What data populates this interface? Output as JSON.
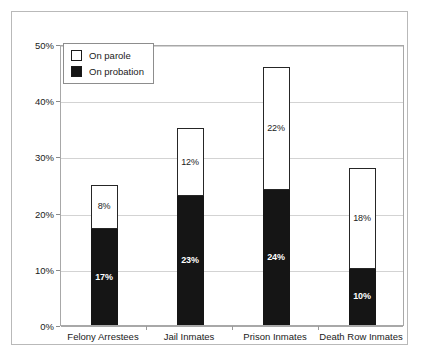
{
  "chart_data": {
    "type": "bar",
    "subtype": "stacked-bar",
    "title": "",
    "subtitle": "",
    "xlabel": "",
    "ylabel": "",
    "ylim": [
      0,
      50
    ],
    "y_tick_labels": [
      "0%",
      "10%",
      "20%",
      "30%",
      "40%",
      "50%"
    ],
    "y_tick_values": [
      0,
      10,
      20,
      30,
      40,
      50
    ],
    "grid": true,
    "legend_position": "top-left-inside",
    "categories": [
      "Felony Arrestees",
      "Jail Inmates",
      "Prison Inmates",
      "Death Row Inmates"
    ],
    "series": [
      {
        "name": "On probation",
        "color": "#151515",
        "text_color": "#ffffff",
        "values": [
          17,
          23,
          24,
          10
        ],
        "data_labels": [
          "17%",
          "23%",
          "24%",
          "10%"
        ]
      },
      {
        "name": "On parole",
        "color": "#ffffff",
        "text_color": "#1a1a1a",
        "values": [
          8,
          12,
          22,
          18
        ],
        "data_labels": [
          "8%",
          "12%",
          "22%",
          "18%"
        ]
      }
    ],
    "stack_totals": [
      25,
      35,
      46,
      28
    ]
  },
  "legend": {
    "items": [
      {
        "label": "On parole",
        "swatch": "white"
      },
      {
        "label": "On probation",
        "swatch": "black"
      }
    ]
  },
  "colors": {
    "probation_fill": "#151515",
    "parole_fill": "#ffffff",
    "bar_outline": "#1a1a1a",
    "gridline": "#d3d3d3",
    "axis_line": "#a8a8a8",
    "frame": "#b9b9b9",
    "text": "#1a1a1a"
  }
}
